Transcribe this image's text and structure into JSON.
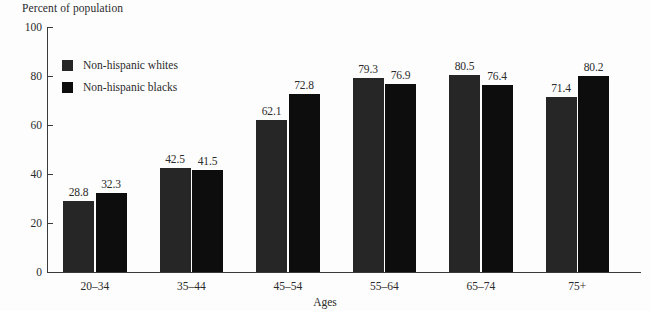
{
  "chart_data": {
    "type": "bar",
    "title": "",
    "xlabel": "Ages",
    "ylabel": "Percent of population",
    "ylim": [
      0,
      100
    ],
    "yticks": [
      0,
      20,
      40,
      60,
      80,
      100
    ],
    "grid": false,
    "legend_position": "upper-left-inside",
    "categories": [
      "20–34",
      "35–44",
      "45–54",
      "55–64",
      "65–74",
      "75+"
    ],
    "series": [
      {
        "name": "Non-hispanic whites",
        "color": "#262626",
        "values": [
          28.8,
          42.5,
          62.1,
          79.3,
          80.5,
          71.4
        ]
      },
      {
        "name": "Non-hispanic blacks",
        "color": "#0d0d0d",
        "values": [
          32.3,
          41.5,
          72.8,
          76.9,
          76.4,
          80.2
        ]
      }
    ]
  }
}
